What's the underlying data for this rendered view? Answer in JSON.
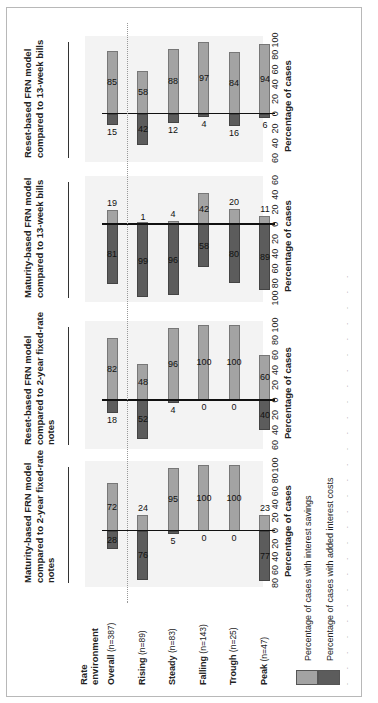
{
  "orientation": "rotated 90 degrees counter-clockwise",
  "rate_environment_header": "Rate environment",
  "rows": [
    {
      "label": "Overall",
      "n": "(n=387)"
    },
    {
      "label": "Rising",
      "n": "(n=89)"
    },
    {
      "label": "Steady",
      "n": "(n=83)"
    },
    {
      "label": "Falling",
      "n": "(n=143)"
    },
    {
      "label": "Trough",
      "n": "(n=25)"
    },
    {
      "label": "Peak",
      "n": "(n=47)"
    }
  ],
  "panels": [
    {
      "title": "Maturity-based FRN model compared to 2-year fixed-rate notes",
      "title_lines": [
        "Maturity-based FRN model",
        "compared to 2-year fixed-rate",
        "notes"
      ],
      "ticks": [
        "80",
        "60",
        "40",
        "20",
        "0",
        "20",
        "40",
        "60",
        "80",
        "100"
      ],
      "axis_title": "Percentage of cases"
    },
    {
      "title": "Reset-based FRN model compared to 2-year fixed-rate notes",
      "title_lines": [
        "Reset-based FRN model",
        "compared to 2-year fixed-rate",
        "notes"
      ],
      "ticks": [
        "60",
        "40",
        "20",
        "0",
        "20",
        "40",
        "60",
        "80",
        "100"
      ],
      "axis_title": "Percentage of cases"
    },
    {
      "title": "Maturity-based FRN model compared to 13-week bills",
      "title_lines": [
        "Maturity-based FRN model",
        "compared to 13-week bills"
      ],
      "ticks": [
        "100",
        "80",
        "60",
        "40",
        "20",
        "0",
        "20",
        "40",
        "60"
      ],
      "axis_title": "Percentage of cases"
    },
    {
      "title": "Reset-based FRN model compared to 13-week bills",
      "title_lines": [
        "Reset-based FRN model",
        "compared to 13-week bills"
      ],
      "ticks": [
        "60",
        "40",
        "20",
        "0",
        "20",
        "40",
        "60",
        "80",
        "100"
      ],
      "axis_title": "Percentage of cases"
    }
  ],
  "legend": [
    {
      "label": "Percentage of cases with interest savings",
      "color": "#a3a3a3"
    },
    {
      "label": "Percentage of cases with added interest costs",
      "color": "#5c5c5c"
    }
  ],
  "chart_data": {
    "type": "bar",
    "subtype": "diverging horizontal bar (small multiples)",
    "categories": [
      "Overall (n=387)",
      "Rising (n=89)",
      "Steady (n=83)",
      "Falling (n=143)",
      "Trough (n=25)",
      "Peak (n=47)"
    ],
    "xlabel": "Percentage of cases",
    "legend_position": "bottom",
    "grid": false,
    "panels": [
      {
        "title": "Maturity-based FRN model compared to 2-year fixed-rate notes",
        "xlim": [
          -80,
          100
        ],
        "series": [
          {
            "name": "Percentage of cases with interest savings",
            "values": [
              72,
              24,
              95,
              100,
              100,
              23
            ]
          },
          {
            "name": "Percentage of cases with added interest costs",
            "values": [
              28,
              76,
              5,
              0,
              0,
              77
            ]
          }
        ]
      },
      {
        "title": "Reset-based FRN model compared to 2-year fixed-rate notes",
        "xlim": [
          -60,
          100
        ],
        "series": [
          {
            "name": "Percentage of cases with interest savings",
            "values": [
              82,
              48,
              96,
              100,
              100,
              60
            ]
          },
          {
            "name": "Percentage of cases with added interest costs",
            "values": [
              18,
              52,
              4,
              0,
              0,
              40
            ]
          }
        ]
      },
      {
        "title": "Maturity-based FRN model compared to 13-week bills",
        "xlim": [
          -100,
          60
        ],
        "series": [
          {
            "name": "Percentage of cases with interest savings",
            "values": [
              19,
              1,
              4,
              42,
              20,
              11
            ]
          },
          {
            "name": "Percentage of cases with added interest costs",
            "values": [
              81,
              99,
              96,
              58,
              80,
              89
            ]
          }
        ]
      },
      {
        "title": "Reset-based FRN model compared to 13-week bills",
        "xlim": [
          -60,
          100
        ],
        "series": [
          {
            "name": "Percentage of cases with interest savings",
            "values": [
              85,
              58,
              88,
              97,
              84,
              94
            ]
          },
          {
            "name": "Percentage of cases with added interest costs",
            "values": [
              15,
              42,
              12,
              4,
              16,
              6
            ]
          }
        ]
      }
    ]
  }
}
